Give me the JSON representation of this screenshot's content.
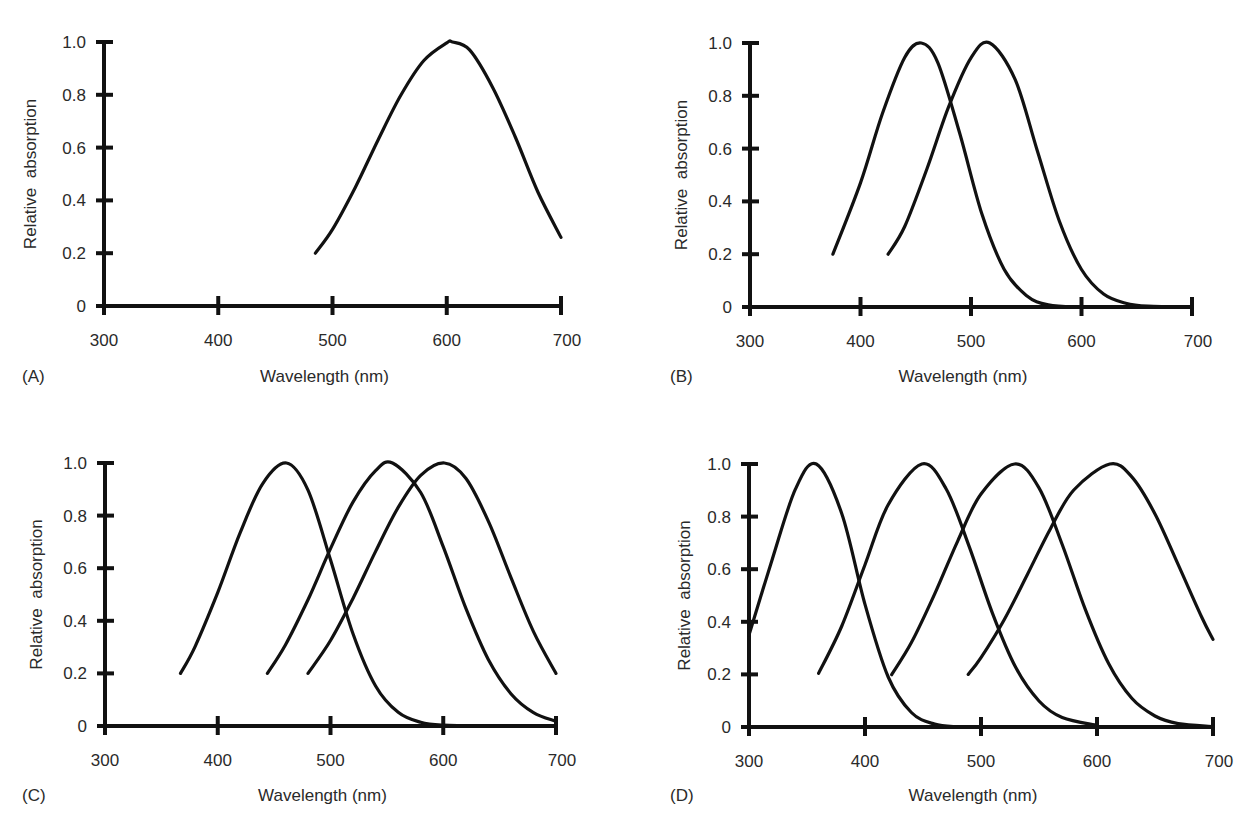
{
  "figure": {
    "axis_titles": {
      "x": "Wavelength (nm)",
      "y": "Relative  absorption"
    },
    "x_ticks": [
      "300",
      "400",
      "500",
      "600",
      "700"
    ],
    "y_ticks": [
      "0",
      "0.2",
      "0.4",
      "0.6",
      "0.8",
      "1.0"
    ],
    "line_color": "#111111",
    "background": "#ffffff"
  },
  "panels": [
    {
      "label": "(A)"
    },
    {
      "label": "(B)"
    },
    {
      "label": "(C)"
    },
    {
      "label": "(D)"
    }
  ],
  "chart_data": [
    {
      "panel": "A",
      "type": "line",
      "title": "",
      "xlabel": "Wavelength (nm)",
      "ylabel": "Relative absorption",
      "xlim": [
        300,
        700
      ],
      "ylim": [
        0,
        1.0
      ],
      "xticks": [
        300,
        400,
        500,
        600,
        700
      ],
      "yticks": [
        0,
        0.2,
        0.4,
        0.6,
        0.8,
        1.0
      ],
      "grid": false,
      "legend": null,
      "series": [
        {
          "name": "pigment 1 (peak ~605 nm)",
          "x": [
            485,
            500,
            520,
            540,
            560,
            580,
            600,
            605,
            620,
            640,
            660,
            680,
            700
          ],
          "y": [
            0.2,
            0.29,
            0.45,
            0.63,
            0.8,
            0.93,
            0.997,
            1.0,
            0.97,
            0.83,
            0.64,
            0.43,
            0.26
          ]
        }
      ]
    },
    {
      "panel": "B",
      "type": "line",
      "title": "",
      "xlabel": "Wavelength (nm)",
      "ylabel": "Relative absorption",
      "xlim": [
        300,
        700
      ],
      "ylim": [
        0,
        1.0
      ],
      "xticks": [
        300,
        400,
        500,
        600,
        700
      ],
      "yticks": [
        0,
        0.2,
        0.4,
        0.6,
        0.8,
        1.0
      ],
      "grid": false,
      "legend": null,
      "series": [
        {
          "name": "pigment 1 (peak ~455 nm)",
          "x": [
            375,
            400,
            420,
            440,
            455,
            470,
            490,
            510,
            530,
            550,
            570,
            600,
            650
          ],
          "y": [
            0.2,
            0.47,
            0.735,
            0.945,
            1.0,
            0.925,
            0.654,
            0.351,
            0.143,
            0.044,
            0.008,
            0.0,
            0.0
          ]
        },
        {
          "name": "pigment 2 (peak ~517 nm)",
          "x": [
            425,
            440,
            460,
            480,
            500,
            517,
            540,
            560,
            580,
            600,
            620,
            640,
            660,
            700
          ],
          "y": [
            0.2,
            0.305,
            0.522,
            0.761,
            0.944,
            1.0,
            0.861,
            0.592,
            0.325,
            0.142,
            0.049,
            0.014,
            0.003,
            0.0
          ]
        }
      ]
    },
    {
      "panel": "C",
      "type": "line",
      "title": "",
      "xlabel": "Wavelength (nm)",
      "ylabel": "Relative absorption",
      "xlim": [
        300,
        700
      ],
      "ylim": [
        0,
        1.0
      ],
      "xticks": [
        300,
        400,
        500,
        600,
        700
      ],
      "yticks": [
        0,
        0.2,
        0.4,
        0.6,
        0.8,
        1.0
      ],
      "grid": false,
      "legend": null,
      "series": [
        {
          "name": "pigment 1 (peak ~461 nm)",
          "x": [
            367,
            380,
            400,
            420,
            440,
            461,
            480,
            500,
            520,
            540,
            560,
            580,
            600,
            640
          ],
          "y": [
            0.2,
            0.303,
            0.508,
            0.736,
            0.923,
            1.0,
            0.897,
            0.632,
            0.35,
            0.152,
            0.052,
            0.014,
            0.003,
            0.0
          ]
        },
        {
          "name": "pigment 2 (peak ~555 nm)",
          "x": [
            444,
            460,
            480,
            500,
            520,
            540,
            555,
            580,
            600,
            620,
            640,
            660,
            680,
            700
          ],
          "y": [
            0.2,
            0.308,
            0.48,
            0.674,
            0.852,
            0.971,
            1.0,
            0.888,
            0.681,
            0.448,
            0.253,
            0.123,
            0.051,
            0.018
          ]
        },
        {
          "name": "pigment 3 (peak ~601 nm)",
          "x": [
            480,
            500,
            520,
            540,
            560,
            580,
            601,
            620,
            640,
            660,
            680,
            700
          ],
          "y": [
            0.2,
            0.325,
            0.486,
            0.664,
            0.831,
            0.953,
            1.0,
            0.942,
            0.779,
            0.565,
            0.359,
            0.2
          ]
        }
      ]
    },
    {
      "panel": "D",
      "type": "line",
      "title": "",
      "xlabel": "Wavelength (nm)",
      "ylabel": "Relative absorption",
      "xlim": [
        300,
        700
      ],
      "ylim": [
        0,
        1.0
      ],
      "xticks": [
        300,
        400,
        500,
        600,
        700
      ],
      "yticks": [
        0,
        0.2,
        0.4,
        0.6,
        0.8,
        1.0
      ],
      "grid": false,
      "legend": null,
      "series": [
        {
          "name": "pigment 1 (peak ~358 nm)",
          "x": [
            300,
            320,
            340,
            358,
            380,
            400,
            420,
            440,
            460,
            480
          ],
          "y": [
            0.35,
            0.637,
            0.904,
            1.0,
            0.811,
            0.466,
            0.19,
            0.055,
            0.011,
            0.0
          ]
        },
        {
          "name": "pigment 2 (peak ~449 nm)",
          "x": [
            360,
            380,
            400,
            420,
            449,
            470,
            490,
            510,
            530,
            550,
            570,
            600
          ],
          "y": [
            0.204,
            0.384,
            0.617,
            0.845,
            1.0,
            0.905,
            0.684,
            0.431,
            0.226,
            0.099,
            0.036,
            0.006
          ]
        },
        {
          "name": "pigment 3 (peak ~529 nm)",
          "x": [
            423,
            440,
            460,
            480,
            500,
            529,
            550,
            570,
            590,
            610,
            630,
            650,
            670,
            700
          ],
          "y": [
            0.199,
            0.321,
            0.505,
            0.708,
            0.886,
            1.0,
            0.909,
            0.694,
            0.446,
            0.241,
            0.109,
            0.042,
            0.013,
            0.002
          ]
        },
        {
          "name": "pigment 4 (peak ~611 nm)",
          "x": [
            489,
            500,
            520,
            540,
            560,
            580,
            611,
            630,
            650,
            670,
            690,
            700
          ],
          "y": [
            0.2,
            0.264,
            0.408,
            0.58,
            0.755,
            0.901,
            1.0,
            0.951,
            0.81,
            0.617,
            0.42,
            0.333
          ]
        }
      ]
    }
  ]
}
